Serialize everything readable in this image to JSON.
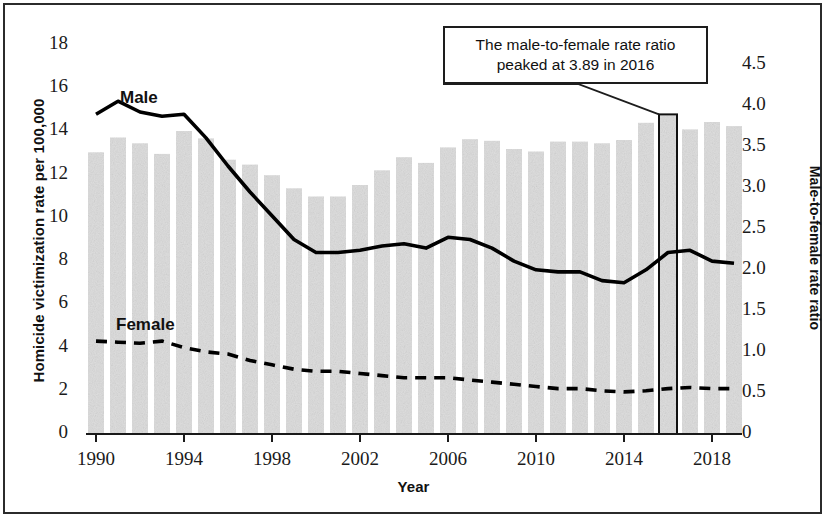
{
  "chart_data": {
    "type": "bar",
    "title": "",
    "subtitle": "",
    "xlabel": "Year",
    "ylabel": "Homicide victimization rate per 100,000",
    "ylabel_right": "Male-to-female rate ratio",
    "xlim": [
      1989.4,
      2019.6
    ],
    "ylim": [
      0,
      19
    ],
    "ylim_right": [
      0,
      4.75
    ],
    "yticks": [
      0,
      2,
      4,
      6,
      8,
      10,
      12,
      14,
      16,
      18
    ],
    "ytick_labels": [
      "0",
      "2",
      "4",
      "6",
      "8",
      "10",
      "12",
      "14",
      "16",
      "18"
    ],
    "yticks_right": [
      0,
      0.5,
      1.0,
      1.5,
      2.0,
      2.5,
      3.0,
      3.5,
      4.0,
      4.5
    ],
    "ytick_labels_right": [
      "0",
      "0.5",
      "1.0",
      "1.5",
      "2.0",
      "2.5",
      "3.0",
      "3.5",
      "4.0",
      "4.5"
    ],
    "xticks": [
      1990,
      1994,
      1998,
      2002,
      2006,
      2010,
      2014,
      2018
    ],
    "xtick_labels": [
      "1990",
      "1994",
      "1998",
      "2002",
      "2006",
      "2010",
      "2014",
      "2018"
    ],
    "grid": false,
    "legend_position": "inline-labels",
    "x": [
      1990,
      1991,
      1992,
      1993,
      1994,
      1995,
      1996,
      1997,
      1998,
      1999,
      2000,
      2001,
      2002,
      2003,
      2004,
      2005,
      2006,
      2007,
      2008,
      2009,
      2010,
      2011,
      2012,
      2013,
      2014,
      2015,
      2016,
      2017,
      2018,
      2019
    ],
    "series": [
      {
        "name": "Male",
        "label": "Male",
        "axis": "left",
        "style": "solid-line",
        "color": "#000000",
        "values": [
          14.8,
          15.4,
          14.9,
          14.7,
          14.8,
          13.7,
          12.4,
          11.2,
          10.1,
          9.0,
          8.4,
          8.4,
          8.5,
          8.7,
          8.8,
          8.6,
          9.1,
          9.0,
          8.6,
          8.0,
          7.6,
          7.5,
          7.5,
          7.1,
          7.0,
          7.6,
          8.4,
          8.5,
          8.0,
          7.9
        ]
      },
      {
        "name": "Female",
        "label": "Female",
        "axis": "left",
        "style": "dashed-line",
        "color": "#000000",
        "values": [
          4.3,
          4.25,
          4.2,
          4.3,
          4.0,
          3.8,
          3.7,
          3.4,
          3.2,
          3.0,
          2.9,
          2.9,
          2.8,
          2.7,
          2.6,
          2.6,
          2.6,
          2.5,
          2.4,
          2.3,
          2.2,
          2.1,
          2.1,
          2.0,
          1.95,
          2.0,
          2.1,
          2.15,
          2.1,
          2.1
        ]
      },
      {
        "name": "Male-to-female rate ratio",
        "label": "",
        "axis": "right",
        "style": "bar",
        "color": "#dedede",
        "values": [
          3.44,
          3.62,
          3.55,
          3.42,
          3.7,
          3.61,
          3.35,
          3.29,
          3.16,
          3.0,
          2.9,
          2.9,
          3.04,
          3.22,
          3.38,
          3.31,
          3.5,
          3.6,
          3.58,
          3.48,
          3.45,
          3.57,
          3.57,
          3.55,
          3.59,
          3.8,
          3.89,
          3.72,
          3.81,
          3.76
        ]
      }
    ],
    "annotations": [
      {
        "name": "ratio-peak-callout",
        "text_line1": "The male-to-female rate ratio",
        "text_line2": "peaked at 3.89 in 2016",
        "points_to_year": 2016,
        "points_to_value": 3.89
      }
    ],
    "highlight": {
      "year": 2016,
      "value": 3.89,
      "style": "black-outlined-bar"
    }
  },
  "series_labels": {
    "male": "Male",
    "female": "Female"
  },
  "colors": {
    "bar_fill": "#dedede",
    "line": "#000000",
    "axis": "#1a1a1a",
    "frame": "#2b2b2b",
    "background": "#ffffff"
  }
}
